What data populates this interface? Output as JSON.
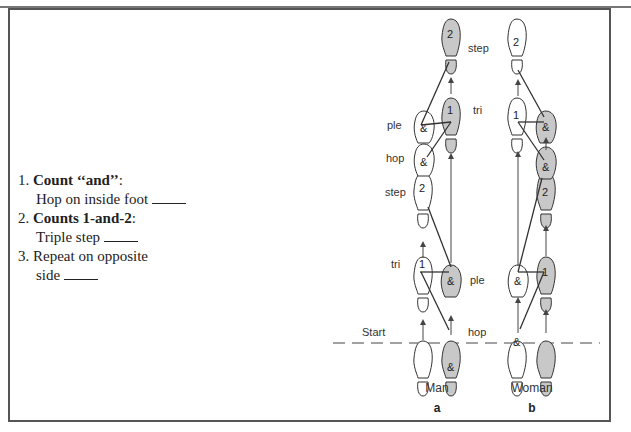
{
  "instructions": {
    "items": [
      {
        "num": "1.",
        "bold": "Count ‘‘and’’",
        "suffix": ":",
        "detail": "Hop on inside foot"
      },
      {
        "num": "2.",
        "bold": "Counts 1-and-2",
        "suffix": ":",
        "detail": "Triple step"
      },
      {
        "num": "3.",
        "bold": "",
        "suffix": "",
        "detail_line1": "Repeat on opposite",
        "detail_line2": "side"
      }
    ]
  },
  "diagram": {
    "start_label": "Start",
    "step_labels": {
      "step_top": "step",
      "tri_top": "tri",
      "ple_top": "ple",
      "hop_mid": "hop",
      "step_mid": "step",
      "tri_bottom": "tri",
      "ple_bottom": "ple",
      "hop_bottom": "hop"
    },
    "man": {
      "caption": "Man",
      "letter": "a",
      "footprints": {
        "left_start": "",
        "right_start": "&",
        "left_tri": "1",
        "right_ple": "&",
        "left_step": "2",
        "left_hop": "&",
        "left_ple": "&",
        "right_tri": "1",
        "right_step": "2"
      }
    },
    "woman": {
      "caption": "Woman",
      "letter": "b",
      "footprints": {
        "left_start": "&",
        "right_start": "",
        "left_ple": "&",
        "right_tri": "1",
        "right_step": "2",
        "right_hop": "&",
        "right_ple": "&",
        "left_tri": "1",
        "left_step": "2"
      }
    },
    "colors": {
      "shaded": "#c8c8c8",
      "outline": "#333333",
      "frame": "#555555"
    }
  }
}
